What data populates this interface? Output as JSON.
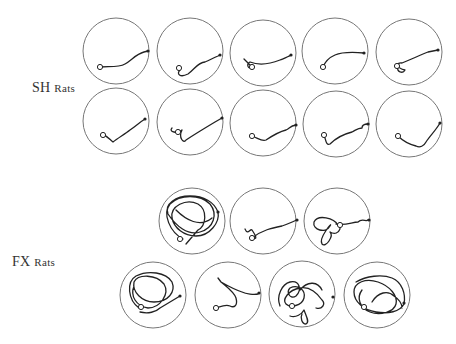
{
  "groups": [
    {
      "label_main": "SH",
      "label_suffix": "Rats",
      "label_pos": [
        32,
        88
      ],
      "arenas": [
        {
          "cx": 116,
          "cy": 51,
          "r": 33,
          "path": "M100,67 C108,66 118,68 125,64 C132,60 136,54 144,52 L148,51",
          "start": [
            100,
            67
          ],
          "end": [
            148,
            51
          ]
        },
        {
          "cx": 190,
          "cy": 51,
          "r": 33,
          "path": "M180,70 C176,74 180,78 188,74 C194,70 198,62 205,62 C210,60 213,58 218,56 L220,55",
          "start": [
            179,
            68
          ],
          "end": [
            220,
            55
          ]
        },
        {
          "cx": 263,
          "cy": 53,
          "r": 33,
          "path": "M244,59 L252,67 C248,70 246,64 250,62 C260,66 270,64 280,60 C285,58 288,57 291,55",
          "start": [
            252,
            67
          ],
          "end": [
            291,
            55
          ]
        },
        {
          "cx": 335,
          "cy": 51,
          "r": 33,
          "path": "M323,67 C325,62 328,58 335,55 C342,52 352,52 364,53",
          "start": [
            323,
            67
          ],
          "end": [
            364,
            53
          ]
        },
        {
          "cx": 409,
          "cy": 52,
          "r": 33,
          "path": "M398,67 C396,72 403,74 405,70 C396,68 396,62 402,63 C410,60 418,56 428,52 L438,50",
          "start": [
            397,
            66
          ],
          "end": [
            438,
            50
          ]
        }
      ],
      "arenas_row2": [
        {
          "cx": 116,
          "cy": 121,
          "r": 33,
          "path": "M103,135 C108,136 110,140 113,142 C118,138 125,134 130,130 C136,126 140,122 145,119",
          "start": [
            103,
            135
          ],
          "end": [
            145,
            119
          ]
        },
        {
          "cx": 190,
          "cy": 122,
          "r": 33,
          "path": "M172,128 C168,132 178,134 182,130 C178,138 184,144 186,140 C195,134 205,128 215,122 L222,118",
          "start": [
            178,
            132
          ],
          "end": [
            222,
            118
          ]
        },
        {
          "cx": 263,
          "cy": 123,
          "r": 33,
          "path": "M252,136 C258,138 262,142 266,140 C272,136 278,132 286,130 C290,128 290,126 296,125",
          "start": [
            252,
            136
          ],
          "end": [
            296,
            125
          ]
        },
        {
          "cx": 336,
          "cy": 124,
          "r": 33,
          "path": "M324,135 C326,140 326,146 330,144 C336,138 344,134 352,132 C356,130 358,128 362,128 C362,126 364,124 368,124",
          "start": [
            324,
            135
          ],
          "end": [
            368,
            124
          ]
        },
        {
          "cx": 409,
          "cy": 124,
          "r": 33,
          "path": "M398,136 C402,140 408,144 416,146 C420,148 424,146 426,142 C430,136 436,130 440,123",
          "start": [
            398,
            136
          ],
          "end": [
            440,
            123
          ]
        }
      ]
    },
    {
      "label_main": "FX",
      "label_suffix": "Rats",
      "label_pos": [
        12,
        262
      ],
      "arenas": [
        {
          "cx": 192,
          "cy": 221,
          "r": 33,
          "type": "dense",
          "path": "M183,239 C170,232 162,214 170,204 C180,194 200,194 210,204 C218,214 214,228 200,232 C188,236 176,226 168,214 C164,204 176,196 190,196 C204,196 214,202 218,212 C220,222 210,236 196,236 C184,236 174,228 172,218 C170,206 186,198 198,204 C208,210 206,226 198,230 L186,244 M176,210 C186,220 200,228 212,218",
          "start": [
            180,
            239
          ],
          "end": [
            218,
            212
          ]
        },
        {
          "cx": 263,
          "cy": 221,
          "r": 33,
          "path": "M245,229 C248,236 250,228 252,230 C256,236 258,240 252,238 C262,230 272,228 282,226 C288,224 292,222 297,220",
          "start": [
            252,
            238
          ],
          "end": [
            297,
            220
          ]
        },
        {
          "cx": 337,
          "cy": 221,
          "r": 33,
          "type": "cluster",
          "path": "M338,225 C334,218 318,214 314,222 C312,230 326,234 330,226 C334,220 318,238 322,244 C326,248 334,236 330,232 C340,238 344,222 336,224 C346,226 352,222 358,222 C362,218 366,222 368,220",
          "start": [
            340,
            225
          ],
          "end": [
            369,
            220
          ]
        }
      ],
      "arenas_row2": [
        {
          "cx": 153,
          "cy": 295,
          "r": 33,
          "type": "dense",
          "path": "M139,308 C128,300 126,282 136,276 C148,270 166,272 172,282 C176,292 168,302 154,302 C142,302 132,292 134,282 C138,274 156,274 164,284 C170,294 160,308 148,308 C136,306 130,296 134,286 M140,312 C148,314 156,312 160,308 L180,296",
          "start": [
            141,
            307
          ],
          "end": [
            180,
            296
          ]
        },
        {
          "cx": 228,
          "cy": 295,
          "r": 33,
          "path": "M218,278 L221,282 C228,286 236,290 242,292 C246,294 254,295 258,294 M221,282 C228,288 234,292 236,298 C238,306 234,308 230,306 C226,304 222,306 216,308",
          "start": [
            216,
            308
          ],
          "end": [
            259,
            293
          ]
        },
        {
          "cx": 302,
          "cy": 294,
          "r": 33,
          "type": "dense-cluster",
          "path": "M280,306 C276,296 282,284 290,282 C300,280 302,290 296,296 C290,300 286,292 290,288 C298,284 306,290 304,298 C302,306 290,308 286,304 C282,300 288,290 300,288 C310,286 318,294 322,300 C326,304 322,310 316,308 M290,316 C296,318 302,314 304,310 C306,316 310,322 306,324 C302,324 300,318 302,314 M300,290 C308,280 318,282 322,290",
          "start": [
            292,
            306
          ],
          "end": [
            333,
            297
          ]
        },
        {
          "cx": 377,
          "cy": 295,
          "r": 33,
          "type": "dense",
          "path": "M356,282 C366,276 382,274 392,278 C402,282 406,294 404,304 C400,312 388,314 376,312 C364,310 354,302 354,292 C354,282 366,278 378,282 C390,286 398,296 396,304 C394,312 380,316 370,312 C360,308 356,298 362,290 M372,302 C378,292 388,290 394,296 C400,300 402,304 402,308",
          "start": [
            364,
            307
          ],
          "end": [
            404,
            303
          ]
        }
      ]
    }
  ]
}
